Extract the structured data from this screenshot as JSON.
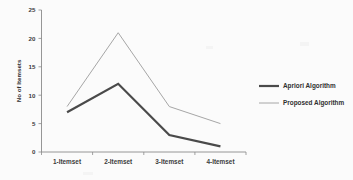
{
  "chart_data": {
    "type": "line",
    "title": "",
    "xlabel": "",
    "ylabel": "No of Itemsets",
    "categories": [
      "1-Itemset",
      "2-Itemset",
      "3-Itemset",
      "4-Itemset"
    ],
    "series": [
      {
        "name": "Apriori Algorithm",
        "values": [
          7,
          12,
          3,
          1
        ],
        "color": "#4a4a4a",
        "line_width": 2.2
      },
      {
        "name": "Proposed Algorithm",
        "values": [
          8,
          21,
          8,
          5
        ],
        "color": "#a6a6a6",
        "line_width": 1.0
      }
    ],
    "ylim": [
      0,
      25
    ],
    "yticks": [
      0,
      5,
      10,
      15,
      20,
      25
    ],
    "ytick_labels": [
      "0",
      "5",
      "10",
      "15",
      "20",
      "25"
    ],
    "grid": false,
    "legend_position": "right"
  },
  "axes": {
    "y_title": "No of Itemsets",
    "y_ticks": [
      {
        "label": "25",
        "value": 25
      },
      {
        "label": "20",
        "value": 20
      },
      {
        "label": "15",
        "value": 15
      },
      {
        "label": "10",
        "value": 10
      },
      {
        "label": "5",
        "value": 5
      },
      {
        "label": "0",
        "value": 0
      }
    ],
    "x_ticks": [
      {
        "label": "1-Itemset"
      },
      {
        "label": "2-Itemset"
      },
      {
        "label": "3-Itemset"
      },
      {
        "label": "4-Itemset"
      }
    ]
  },
  "legend": {
    "items": [
      {
        "label": "Apriori Algorithm",
        "color": "#4a4a4a",
        "line_width": 2.2
      },
      {
        "label": "Proposed Algorithm",
        "color": "#a6a6a6",
        "line_width": 1.0
      }
    ]
  },
  "colors": {
    "background": "#fbfbfb",
    "axis": "#8a8a8a",
    "text": "#2f2f2f",
    "series_apriori": "#4a4a4a",
    "series_proposed": "#a6a6a6"
  }
}
